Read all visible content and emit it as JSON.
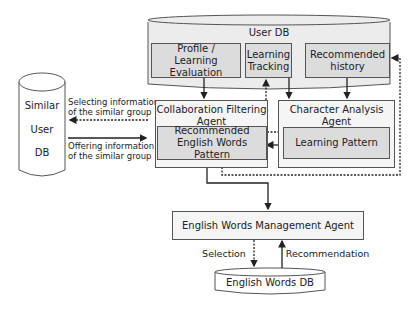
{
  "user_db": {
    "title": "User DB",
    "items": [
      {
        "label_line1": "Profile /",
        "label_line2": "Learning Evaluation"
      },
      {
        "label_line1": "Learning",
        "label_line2": "Tracking"
      },
      {
        "label_line1": "Recommended",
        "label_line2": "history"
      }
    ]
  },
  "similar_db": {
    "lines": [
      "Similar",
      "User",
      "DB"
    ]
  },
  "collab_agent": {
    "title_line1": "Collaboration Filtering",
    "title_line2": "Agent",
    "inner_line1": "Recommended",
    "inner_line2": "English Words Pattern"
  },
  "char_agent": {
    "title_line1": "Character Analysis",
    "title_line2": "Agent",
    "inner": "Learning Pattern"
  },
  "edges": {
    "selecting_line1": "Selecting information",
    "selecting_line2": "of the similar group",
    "offering_line1": "Offering information",
    "offering_line2": "of the similar group",
    "selection": "Selection",
    "recommendation": "Recommendation"
  },
  "mgmt_agent": {
    "title": "English Words Management Agent"
  },
  "words_db": {
    "title": "English Words DB"
  }
}
